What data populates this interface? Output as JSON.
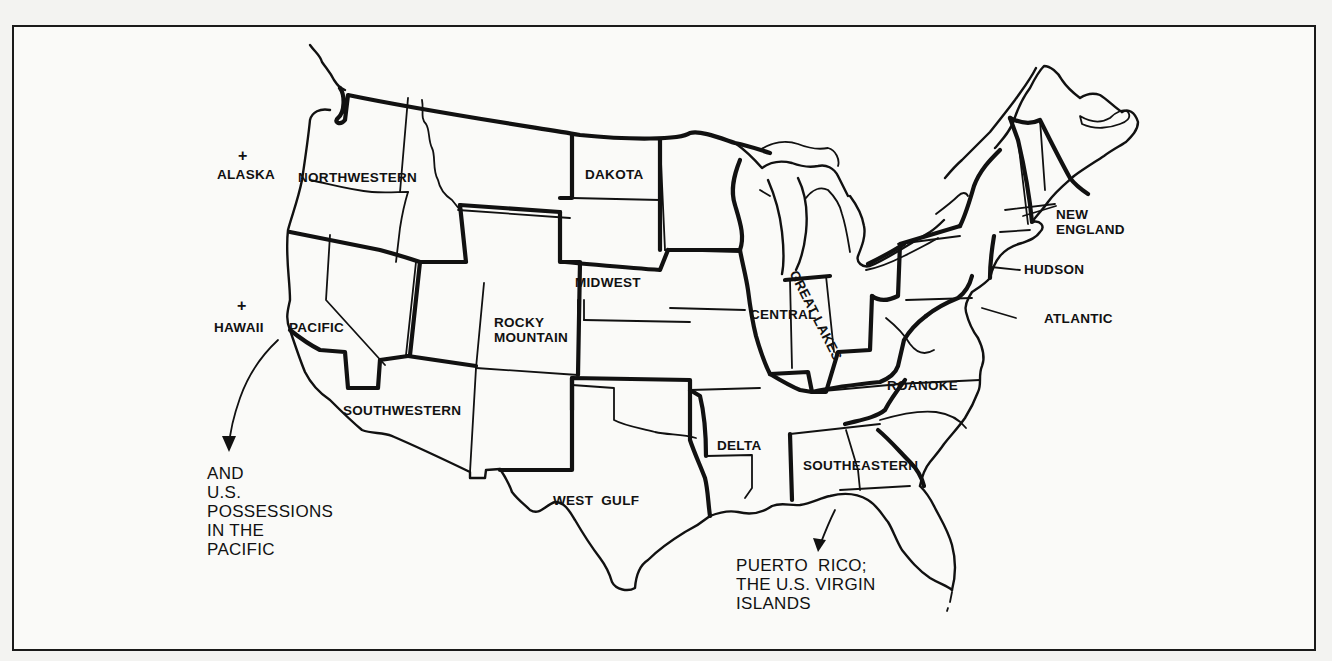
{
  "map": {
    "type": "regional division map",
    "subject": "United States regions",
    "frame": {
      "border_color": "#1a1a1a",
      "background": "#fafaf8"
    },
    "regions": [
      {
        "id": "northwestern",
        "label": "NORTHWESTERN"
      },
      {
        "id": "pacific",
        "label": "PACIFIC"
      },
      {
        "id": "southwestern",
        "label": "SOUTHWESTERN"
      },
      {
        "id": "rocky-mountain",
        "label": "ROCKY\nMOUNTAIN"
      },
      {
        "id": "dakota",
        "label": "DAKOTA"
      },
      {
        "id": "midwest",
        "label": "MIDWEST"
      },
      {
        "id": "west-gulf",
        "label": "WEST  GULF"
      },
      {
        "id": "central",
        "label": "CENTRAL"
      },
      {
        "id": "great-lakes",
        "label": "GREAT LAKES"
      },
      {
        "id": "delta",
        "label": "DELTA"
      },
      {
        "id": "southeastern",
        "label": "SOUTHEASTERN"
      },
      {
        "id": "roanoke",
        "label": "ROANOKE"
      },
      {
        "id": "atlantic",
        "label": "ATLANTIC"
      },
      {
        "id": "hudson",
        "label": "HUDSON"
      },
      {
        "id": "new-england",
        "label": "NEW\nENGLAND"
      }
    ],
    "markers": [
      {
        "id": "alaska",
        "label": "ALASKA",
        "symbol": "+"
      },
      {
        "id": "hawaii",
        "label": "HAWAII",
        "symbol": "+"
      }
    ],
    "annotations": [
      {
        "id": "pacific-possessions",
        "text": "AND\nU.S.\nPOSSESSIONS\nIN THE\nPACIFIC"
      },
      {
        "id": "puerto-rico",
        "text": "PUERTO  RICO;\nTHE U.S. VIRGIN\nISLANDS"
      }
    ]
  }
}
